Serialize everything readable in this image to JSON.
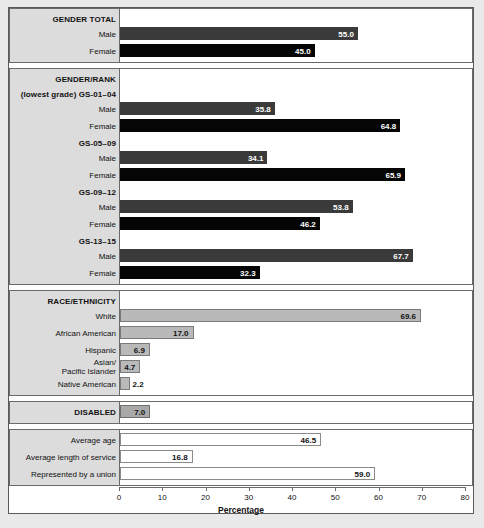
{
  "chart_data": {
    "type": "bar",
    "orientation": "horizontal",
    "title": "",
    "xlabel": "Percentage",
    "ylabel": "",
    "xlim": [
      0,
      80
    ],
    "xticks": [
      0,
      10,
      20,
      30,
      40,
      50,
      60,
      70,
      80
    ],
    "grid": false,
    "legend": null,
    "sections": [
      {
        "heading": "GENDER TOTAL",
        "subheading": "",
        "rows": [
          {
            "label": "Male",
            "value": 55.0,
            "display": "55.0",
            "style": "dark",
            "label_position": "inside"
          },
          {
            "label": "Female",
            "value": 45.0,
            "display": "45.0",
            "style": "black",
            "label_position": "inside"
          }
        ]
      },
      {
        "heading": "GENDER/RANK",
        "subheading": "(lowest grade) GS-01–04",
        "groups": [
          {
            "group_label": "",
            "rows": [
              {
                "label": "Male",
                "value": 35.8,
                "display": "35.8",
                "style": "dark",
                "label_position": "inside"
              },
              {
                "label": "Female",
                "value": 64.8,
                "display": "64.8",
                "style": "black",
                "label_position": "inside"
              }
            ]
          },
          {
            "group_label": "GS-05–09",
            "rows": [
              {
                "label": "Male",
                "value": 34.1,
                "display": "34.1",
                "style": "dark",
                "label_position": "inside"
              },
              {
                "label": "Female",
                "value": 65.9,
                "display": "65.9",
                "style": "black",
                "label_position": "inside"
              }
            ]
          },
          {
            "group_label": "GS-09–12",
            "rows": [
              {
                "label": "Male",
                "value": 53.8,
                "display": "53.8",
                "style": "dark",
                "label_position": "inside"
              },
              {
                "label": "Female",
                "value": 46.2,
                "display": "46.2",
                "style": "black",
                "label_position": "inside"
              }
            ]
          },
          {
            "group_label": "GS-13–15",
            "rows": [
              {
                "label": "Male",
                "value": 67.7,
                "display": "67.7",
                "style": "dark",
                "label_position": "inside"
              },
              {
                "label": "Female",
                "value": 32.3,
                "display": "32.3",
                "style": "black",
                "label_position": "inside"
              }
            ]
          }
        ]
      },
      {
        "heading": "RACE/ETHNICITY",
        "subheading": "",
        "rows": [
          {
            "label": "White",
            "value": 69.6,
            "display": "69.6",
            "style": "gray",
            "label_position": "inside"
          },
          {
            "label": "African American",
            "value": 17.0,
            "display": "17.0",
            "style": "gray",
            "label_position": "inside"
          },
          {
            "label": "Hispanic",
            "value": 6.9,
            "display": "6.9",
            "style": "gray",
            "label_position": "inside"
          },
          {
            "label": "Asian/\nPacific Islander",
            "value": 4.7,
            "display": "4.7",
            "style": "gray",
            "label_position": "inside"
          },
          {
            "label": "Native American",
            "value": 2.2,
            "display": "2.2",
            "style": "gray",
            "label_position": "outside"
          }
        ]
      },
      {
        "heading": "DISABLED",
        "subheading": "",
        "rows": [
          {
            "label": "DISABLED",
            "value": 7.0,
            "display": "7.0",
            "style": "midgray",
            "label_position": "inside"
          }
        ]
      },
      {
        "heading": "",
        "subheading": "",
        "rows": [
          {
            "label": "Average age",
            "value": 46.5,
            "display": "46.5",
            "style": "white",
            "label_position": "inside"
          },
          {
            "label": "Average length of service",
            "value": 16.8,
            "display": "16.8",
            "style": "white",
            "label_position": "inside"
          },
          {
            "label": "Represented by a union",
            "value": 59.0,
            "display": "59.0",
            "style": "white",
            "label_position": "inside"
          }
        ]
      }
    ]
  },
  "axis": {
    "title": "Percentage",
    "ticks": [
      "0",
      "10",
      "20",
      "30",
      "40",
      "50",
      "60",
      "70",
      "80"
    ]
  },
  "headings": {
    "gender_total": "GENDER TOTAL",
    "gender_rank": "GENDER/RANK",
    "gender_rank_sub": "(lowest grade) GS-01–04",
    "gs_05_09": "GS-05–09",
    "gs_09_12": "GS-09–12",
    "gs_13_15": "GS-13–15",
    "race_ethnicity": "RACE/ETHNICITY",
    "disabled": "DISABLED"
  },
  "colors": {
    "male_bar": "#3a3a3a",
    "female_bar": "#050505",
    "race_bar": "#b9b9b9",
    "disabled_bar": "#a9a9a9",
    "plain_bar": "#ffffff",
    "label_column": "#dcdcdc",
    "frame": "#5b5b5b"
  }
}
